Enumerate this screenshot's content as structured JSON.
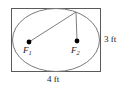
{
  "figure": {
    "kind": "geometry-diagram",
    "colors": {
      "stroke": "#6e6e6e",
      "ellipse_stroke": "#7a7a7a",
      "rect_stroke": "#5a5a5a",
      "point_fill": "#000000",
      "text": "#1a1a1a",
      "background": "#ffffff"
    },
    "rectangle": {
      "x": 11,
      "y": 8,
      "width": 90,
      "height": 64
    },
    "ellipse": {
      "cx": 56,
      "cy": 40,
      "rx": 44,
      "ry": 32
    },
    "foci": [
      {
        "id": "F1",
        "label": "F",
        "subscript": "1",
        "cx": 29,
        "cy": 42,
        "r": 2.4
      },
      {
        "id": "F2",
        "label": "F",
        "subscript": "2",
        "cx": 77,
        "cy": 41,
        "r": 2.4
      }
    ],
    "ellipse_point": {
      "x": 76,
      "y": 12
    },
    "focal_radii": [
      {
        "from": "F1",
        "to": "ellipse_point",
        "x1": 29,
        "y1": 42,
        "x2": 76,
        "y2": 12
      },
      {
        "from": "F2",
        "to": "ellipse_point",
        "x1": 77,
        "y1": 41,
        "x2": 76,
        "y2": 12
      }
    ],
    "labels": {
      "height": "3 ft",
      "width": "4 ft",
      "focus_1": "F",
      "focus_1_sub": "1",
      "focus_2": "F",
      "focus_2_sub": "2"
    }
  }
}
